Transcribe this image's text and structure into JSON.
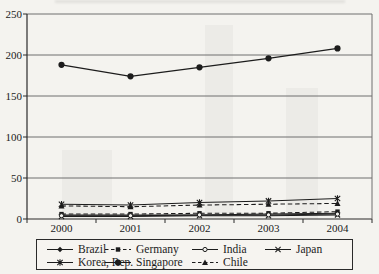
{
  "chart_data": {
    "type": "line",
    "x": [
      2000,
      2001,
      2002,
      2003,
      2004
    ],
    "series": [
      {
        "name": "Brazil",
        "marker": "diamond",
        "dash": false,
        "values": [
          5,
          5,
          5,
          6,
          7
        ]
      },
      {
        "name": "Germany",
        "marker": "square",
        "dash": true,
        "values": [
          6,
          6,
          7,
          7,
          9
        ]
      },
      {
        "name": "India",
        "marker": "circle-open",
        "dash": false,
        "values": [
          4,
          4,
          5,
          5,
          6
        ]
      },
      {
        "name": "Japan",
        "marker": "x",
        "dash": false,
        "values": [
          3,
          3,
          4,
          4,
          5
        ]
      },
      {
        "name": "Korea, Rep.",
        "marker": "asterisk",
        "dash": false,
        "values": [
          18,
          17,
          20,
          22,
          25
        ]
      },
      {
        "name": "Singapore",
        "marker": "circle",
        "dash": false,
        "values": [
          188,
          174,
          185,
          196,
          208
        ]
      },
      {
        "name": "Chile",
        "marker": "triangle",
        "dash": true,
        "values": [
          16,
          15,
          17,
          18,
          19
        ]
      }
    ],
    "title": "",
    "xlabel": "",
    "ylabel": "",
    "ylim": [
      0,
      250
    ],
    "yticks": [
      0,
      50,
      100,
      150,
      200,
      250
    ],
    "grid": true,
    "legend_position": "bottom",
    "legend_rows": [
      [
        "Brazil",
        "Germany",
        "India",
        "Japan"
      ],
      [
        "Korea, Rep.",
        "Singapore",
        "Chile"
      ]
    ]
  },
  "colors": {
    "line": "#1c1c1c",
    "grid": "#6e6e6e",
    "axis": "#2a2a2a",
    "text": "#1b1b1b",
    "background": "#f4f3ef"
  }
}
